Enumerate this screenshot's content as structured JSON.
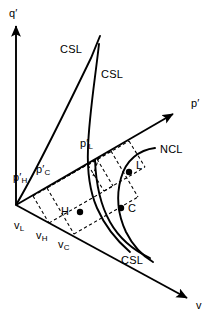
{
  "figure": {
    "type": "3d-state-diagram",
    "background_color": "#ffffff",
    "line_color": "#000000"
  },
  "axes": [
    {
      "id": "q-axis",
      "label": "q",
      "prime": "′",
      "direction": "vertical-up",
      "origin": [
        16,
        205
      ],
      "tip": [
        16,
        22
      ]
    },
    {
      "id": "p-axis",
      "label": "p",
      "prime": "′",
      "direction": "upper-right",
      "origin": [
        16,
        205
      ],
      "tip": [
        176,
        112
      ]
    },
    {
      "id": "v-axis",
      "label": "v",
      "prime": "",
      "direction": "lower-right",
      "origin": [
        16,
        205
      ],
      "tip": [
        190,
        300
      ]
    }
  ],
  "curves": [
    {
      "id": "csl-projection-qp",
      "label": "CSL",
      "style": "solid",
      "label_pos": [
        60,
        44
      ]
    },
    {
      "id": "csl-space-curve",
      "label": "CSL",
      "style": "solid",
      "label_pos": [
        101,
        69
      ]
    },
    {
      "id": "csl-projection-vp",
      "label": "CSL",
      "style": "solid",
      "label_pos": [
        121,
        255
      ]
    },
    {
      "id": "ncl-curve",
      "label": "NCL",
      "style": "solid",
      "label_pos": [
        160,
        144
      ]
    }
  ],
  "points": [
    {
      "id": "point-L",
      "label": "L",
      "marker": "filled-dot",
      "at": [
        128,
        172
      ],
      "label_pos": [
        136,
        160
      ]
    },
    {
      "id": "point-C",
      "label": "C",
      "marker": "filled-dot",
      "at": [
        121,
        208
      ],
      "label_pos": [
        129,
        205
      ]
    },
    {
      "id": "point-H",
      "label": "H",
      "marker": "filled-dot",
      "at": [
        80,
        212
      ],
      "label_pos": [
        62,
        206
      ]
    }
  ],
  "tick_labels": {
    "p_axis": [
      {
        "id": "p-h",
        "base": "p",
        "prime": "′",
        "sub": "H",
        "pos": [
          20,
          174
        ]
      },
      {
        "id": "p-c",
        "base": "p",
        "prime": "′",
        "sub": "C",
        "pos": [
          40,
          166
        ]
      },
      {
        "id": "p-l",
        "base": "p",
        "prime": "′",
        "sub": "L",
        "pos": [
          82,
          139
        ]
      }
    ],
    "v_axis": [
      {
        "id": "v-l",
        "base": "v",
        "prime": "",
        "sub": "L",
        "pos": [
          17,
          222
        ]
      },
      {
        "id": "v-h",
        "base": "v",
        "prime": "",
        "sub": "H",
        "pos": [
          38,
          232
        ]
      },
      {
        "id": "v-c",
        "base": "v",
        "prime": "",
        "sub": "C",
        "pos": [
          59,
          241
        ]
      }
    ]
  },
  "construction_lines": {
    "style": "dashed",
    "note": "Dashed projection parallelograms linking H, C and L to the p' and v axes"
  }
}
